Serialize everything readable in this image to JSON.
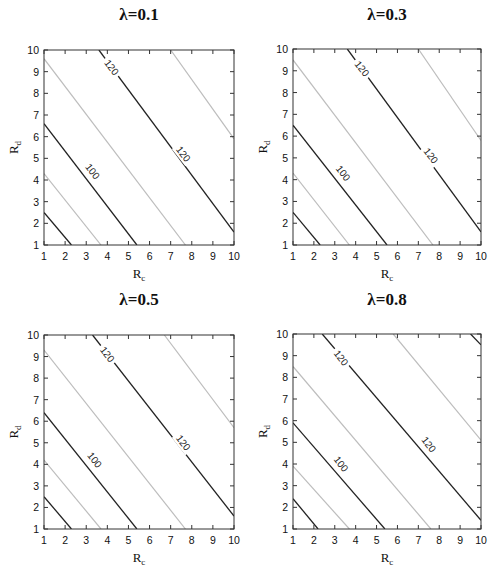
{
  "figure": {
    "width": 497,
    "height": 572,
    "colors": {
      "dark_contour": "#222222",
      "light_contour": "#bdbdbd",
      "frame": "#333333",
      "text": "#111111",
      "background": "#ffffff"
    }
  },
  "chart_data": [
    {
      "type": "contour",
      "title": "λ=0.1",
      "xlabel": "R_c",
      "ylabel": "R_d",
      "xlim": [
        1,
        10
      ],
      "ylim": [
        1,
        10
      ],
      "xticks": [
        1,
        2,
        3,
        4,
        5,
        6,
        7,
        8,
        9,
        10
      ],
      "yticks": [
        1,
        2,
        3,
        4,
        5,
        6,
        7,
        8,
        9,
        10
      ],
      "grid": false,
      "frame_px": {
        "x0": 44,
        "y0": 50,
        "x1": 234,
        "y1": 245
      },
      "title_px": {
        "x": 139,
        "y": 20
      },
      "contours": [
        {
          "style": "dark",
          "points": [
            [
              1,
              2.5
            ],
            [
              2.3,
              1
            ]
          ]
        },
        {
          "style": "light",
          "points": [
            [
              1,
              4.3
            ],
            [
              3.7,
              1
            ]
          ]
        },
        {
          "style": "dark",
          "level": 100,
          "points": [
            [
              1,
              6.6
            ],
            [
              5.4,
              1
            ]
          ]
        },
        {
          "style": "light",
          "points": [
            [
              1,
              9.6
            ],
            [
              7.7,
              1
            ]
          ]
        },
        {
          "style": "dark",
          "level": 120,
          "points": [
            [
              3.6,
              10
            ],
            [
              10,
              1.6
            ]
          ]
        },
        {
          "style": "light",
          "points": [
            [
              7.0,
              10
            ],
            [
              10,
              5.9
            ]
          ]
        }
      ],
      "labels": [
        {
          "text": "100",
          "x": 3.3,
          "y": 4.4
        },
        {
          "text": "120",
          "x": 4.2,
          "y": 9.2
        },
        {
          "text": "120",
          "x": 7.6,
          "y": 5.2
        }
      ]
    },
    {
      "type": "contour",
      "title": "λ=0.3",
      "xlabel": "R_c",
      "ylabel": "R_d",
      "xlim": [
        1,
        10
      ],
      "ylim": [
        1,
        10
      ],
      "xticks": [
        1,
        2,
        3,
        4,
        5,
        6,
        7,
        8,
        9,
        10
      ],
      "yticks": [
        1,
        2,
        3,
        4,
        5,
        6,
        7,
        8,
        9,
        10
      ],
      "grid": false,
      "frame_px": {
        "x0": 293,
        "y0": 49,
        "x1": 481,
        "y1": 245
      },
      "title_px": {
        "x": 387,
        "y": 20
      },
      "contours": [
        {
          "style": "dark",
          "points": [
            [
              1,
              2.5
            ],
            [
              2.3,
              1
            ]
          ]
        },
        {
          "style": "light",
          "points": [
            [
              1,
              4.3
            ],
            [
              3.7,
              1
            ]
          ]
        },
        {
          "style": "dark",
          "level": 100,
          "points": [
            [
              1,
              6.5
            ],
            [
              5.5,
              1
            ]
          ]
        },
        {
          "style": "light",
          "points": [
            [
              1,
              9.5
            ],
            [
              7.7,
              1
            ]
          ]
        },
        {
          "style": "dark",
          "level": 120,
          "points": [
            [
              3.6,
              10
            ],
            [
              10,
              1.6
            ]
          ]
        },
        {
          "style": "light",
          "points": [
            [
              7.0,
              10
            ],
            [
              10,
              5.8
            ]
          ]
        }
      ],
      "labels": [
        {
          "text": "100",
          "x": 3.4,
          "y": 4.3
        },
        {
          "text": "120",
          "x": 4.3,
          "y": 9.1
        },
        {
          "text": "120",
          "x": 7.6,
          "y": 5.1
        }
      ]
    },
    {
      "type": "contour",
      "title": "λ=0.5",
      "xlabel": "R_c",
      "ylabel": "R_d",
      "xlim": [
        1,
        10
      ],
      "ylim": [
        1,
        10
      ],
      "xticks": [
        1,
        2,
        3,
        4,
        5,
        6,
        7,
        8,
        9,
        10
      ],
      "yticks": [
        1,
        2,
        3,
        4,
        5,
        6,
        7,
        8,
        9,
        10
      ],
      "grid": false,
      "frame_px": {
        "x0": 44,
        "y0": 335,
        "x1": 234,
        "y1": 529
      },
      "title_px": {
        "x": 139,
        "y": 305
      },
      "contours": [
        {
          "style": "dark",
          "points": [
            [
              1,
              2.5
            ],
            [
              2.3,
              1
            ]
          ]
        },
        {
          "style": "light",
          "points": [
            [
              1,
              4.2
            ],
            [
              3.7,
              1
            ]
          ]
        },
        {
          "style": "dark",
          "level": 100,
          "points": [
            [
              1,
              6.4
            ],
            [
              5.4,
              1
            ]
          ]
        },
        {
          "style": "light",
          "points": [
            [
              1,
              9.3
            ],
            [
              7.7,
              1
            ]
          ]
        },
        {
          "style": "dark",
          "level": 120,
          "points": [
            [
              3.3,
              10
            ],
            [
              10,
              1.6
            ]
          ]
        },
        {
          "style": "light",
          "points": [
            [
              6.7,
              10
            ],
            [
              10,
              5.7
            ]
          ]
        }
      ],
      "labels": [
        {
          "text": "100",
          "x": 3.4,
          "y": 4.2
        },
        {
          "text": "120",
          "x": 4.0,
          "y": 9.1
        },
        {
          "text": "120",
          "x": 7.6,
          "y": 5.0
        }
      ]
    },
    {
      "type": "contour",
      "title": "λ=0.8",
      "xlabel": "R_c",
      "ylabel": "R_d",
      "xlim": [
        1,
        10
      ],
      "ylim": [
        1,
        10
      ],
      "xticks": [
        1,
        2,
        3,
        4,
        5,
        6,
        7,
        8,
        9,
        10
      ],
      "yticks": [
        1,
        2,
        3,
        4,
        5,
        6,
        7,
        8,
        9,
        10
      ],
      "grid": false,
      "frame_px": {
        "x0": 293,
        "y0": 334,
        "x1": 481,
        "y1": 529
      },
      "title_px": {
        "x": 387,
        "y": 305
      },
      "contours": [
        {
          "style": "dark",
          "points": [
            [
              1,
              2.4
            ],
            [
              2.2,
              1
            ]
          ]
        },
        {
          "style": "light",
          "points": [
            [
              1,
              3.9
            ],
            [
              3.7,
              1
            ]
          ]
        },
        {
          "style": "dark",
          "level": 100,
          "points": [
            [
              1,
              5.9
            ],
            [
              5.4,
              1
            ]
          ]
        },
        {
          "style": "light",
          "points": [
            [
              1,
              8.5
            ],
            [
              7.6,
              1
            ]
          ]
        },
        {
          "style": "dark",
          "level": 120,
          "points": [
            [
              2.4,
              10
            ],
            [
              10,
              1.4
            ]
          ]
        },
        {
          "style": "light",
          "points": [
            [
              5.8,
              10
            ],
            [
              10,
              5.1
            ]
          ]
        },
        {
          "style": "dark",
          "points": [
            [
              9.5,
              10
            ],
            [
              10,
              9.5
            ]
          ]
        }
      ],
      "labels": [
        {
          "text": "100",
          "x": 3.3,
          "y": 4.0
        },
        {
          "text": "120",
          "x": 3.3,
          "y": 8.9
        },
        {
          "text": "120",
          "x": 7.5,
          "y": 4.9
        }
      ]
    }
  ]
}
